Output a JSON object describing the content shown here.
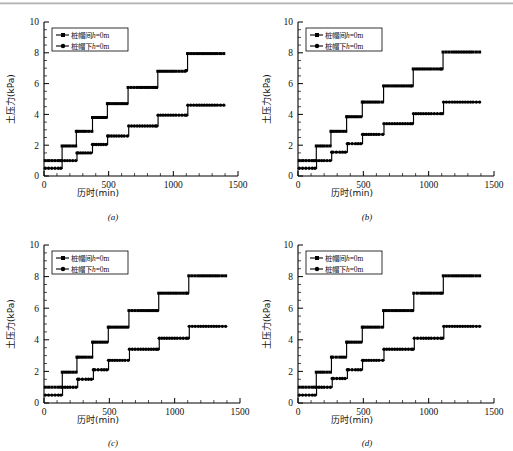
{
  "figure": {
    "background": "#ffffff",
    "ink": "#000000",
    "panel_count": 4
  },
  "axes": {
    "x_title": "历时(min)",
    "y_title": "土压力(kPa)",
    "x_ticks": [
      0,
      500,
      1000,
      1500
    ],
    "y_ticks": [
      0,
      2,
      4,
      6,
      8,
      10
    ],
    "x_minor_step": 100,
    "y_minor_step": 0.5,
    "xlim": [
      0,
      1500
    ],
    "ylim": [
      0,
      10
    ],
    "grid": false
  },
  "legend": {
    "position": "upper-left",
    "entries": [
      {
        "label": "桩帽间",
        "suffix": "h",
        "equals": "=0m",
        "marker": "square"
      },
      {
        "label": "桩帽下",
        "suffix": "h",
        "equals": "=0m",
        "marker": "circle"
      }
    ]
  },
  "chart_data": [
    {
      "id": "a",
      "panel_label": "(a)",
      "type": "line",
      "title": "",
      "xlabel": "历时(min)",
      "ylabel": "土压力(kPa)",
      "xlim": [
        0,
        1500
      ],
      "ylim": [
        0,
        10
      ],
      "grid": false,
      "series": [
        {
          "name": "桩帽间h=0m",
          "marker": "square",
          "x": [
            10,
            60,
            110,
            130,
            140,
            200,
            245,
            250,
            260,
            320,
            370,
            375,
            385,
            440,
            480,
            490,
            500,
            560,
            620,
            640,
            650,
            720,
            800,
            860,
            870,
            880,
            940,
            1020,
            1090,
            1100,
            1110,
            1180,
            1260,
            1340,
            1390
          ],
          "y": [
            1.0,
            1.0,
            1.0,
            1.0,
            1.95,
            1.95,
            1.95,
            2.9,
            2.9,
            2.9,
            2.9,
            3.8,
            3.8,
            3.8,
            3.8,
            4.7,
            4.7,
            4.7,
            4.7,
            4.7,
            5.75,
            5.75,
            5.75,
            5.75,
            5.75,
            6.8,
            6.8,
            6.8,
            6.8,
            6.85,
            7.95,
            7.95,
            7.95,
            7.95,
            7.95
          ]
        },
        {
          "name": "桩帽下h=0m",
          "marker": "circle",
          "x": [
            10,
            60,
            110,
            130,
            140,
            200,
            245,
            255,
            265,
            320,
            360,
            375,
            385,
            440,
            480,
            492,
            502,
            560,
            620,
            645,
            655,
            720,
            800,
            860,
            872,
            882,
            940,
            1020,
            1090,
            1102,
            1112,
            1180,
            1260,
            1340,
            1390
          ],
          "y": [
            0.5,
            0.5,
            0.5,
            0.5,
            1.0,
            1.0,
            1.0,
            1.5,
            1.5,
            1.5,
            1.5,
            2.05,
            2.05,
            2.05,
            2.05,
            2.6,
            2.6,
            2.6,
            2.6,
            2.6,
            3.25,
            3.25,
            3.25,
            3.25,
            3.25,
            3.95,
            3.95,
            3.95,
            3.95,
            3.95,
            4.6,
            4.6,
            4.6,
            4.6,
            4.6
          ]
        }
      ]
    },
    {
      "id": "b",
      "panel_label": "(b)",
      "type": "line",
      "title": "",
      "xlabel": "历时(min)",
      "ylabel": "土压力(kPa)",
      "xlim": [
        0,
        1500
      ],
      "ylim": [
        0,
        10
      ],
      "grid": false,
      "series": [
        {
          "name": "桩帽间h=0m",
          "marker": "square",
          "x": [
            10,
            60,
            110,
            130,
            140,
            200,
            245,
            252,
            262,
            320,
            365,
            372,
            382,
            440,
            480,
            492,
            502,
            560,
            620,
            645,
            655,
            720,
            800,
            860,
            872,
            882,
            940,
            1020,
            1090,
            1100,
            1110,
            1180,
            1260,
            1340,
            1390
          ],
          "y": [
            1.0,
            1.0,
            1.0,
            1.0,
            1.95,
            1.95,
            1.95,
            2.9,
            2.9,
            2.9,
            2.9,
            3.85,
            3.85,
            3.85,
            3.85,
            4.8,
            4.8,
            4.8,
            4.8,
            4.8,
            5.85,
            5.85,
            5.85,
            5.85,
            5.85,
            6.95,
            6.95,
            6.95,
            6.95,
            6.95,
            8.05,
            8.05,
            8.05,
            8.05,
            8.05
          ]
        },
        {
          "name": "桩帽下h=0m",
          "marker": "circle",
          "x": [
            10,
            60,
            110,
            130,
            142,
            200,
            245,
            258,
            268,
            320,
            362,
            378,
            388,
            440,
            480,
            494,
            504,
            560,
            620,
            648,
            658,
            720,
            800,
            860,
            874,
            884,
            940,
            1020,
            1090,
            1104,
            1114,
            1180,
            1260,
            1340,
            1390
          ],
          "y": [
            0.5,
            0.5,
            0.5,
            0.5,
            1.0,
            1.0,
            1.0,
            1.55,
            1.55,
            1.55,
            1.55,
            2.1,
            2.1,
            2.1,
            2.1,
            2.7,
            2.7,
            2.7,
            2.7,
            2.7,
            3.4,
            3.4,
            3.4,
            3.4,
            3.4,
            4.05,
            4.05,
            4.05,
            4.05,
            4.05,
            4.8,
            4.8,
            4.8,
            4.8,
            4.8
          ]
        }
      ]
    },
    {
      "id": "c",
      "panel_label": "(c)",
      "type": "line",
      "title": "",
      "xlabel": "历时(min)",
      "ylabel": "土压力(kPa)",
      "xlim": [
        0,
        1500
      ],
      "ylim": [
        0,
        10
      ],
      "grid": false,
      "series": [
        {
          "name": "桩帽间h=0m",
          "marker": "square",
          "x": [
            10,
            60,
            110,
            130,
            140,
            200,
            245,
            252,
            262,
            320,
            365,
            372,
            382,
            440,
            480,
            492,
            502,
            560,
            620,
            640,
            650,
            720,
            800,
            855,
            868,
            878,
            940,
            1020,
            1085,
            1098,
            1108,
            1180,
            1260,
            1340,
            1390
          ],
          "y": [
            1.0,
            1.0,
            1.0,
            1.0,
            1.95,
            1.95,
            1.95,
            2.9,
            2.9,
            2.9,
            2.9,
            3.85,
            3.85,
            3.85,
            3.85,
            4.8,
            4.8,
            4.8,
            4.8,
            4.8,
            5.85,
            5.85,
            5.85,
            5.85,
            5.85,
            6.95,
            6.95,
            6.95,
            6.95,
            6.95,
            8.05,
            8.05,
            8.05,
            8.05,
            8.05
          ]
        },
        {
          "name": "桩帽下h=0m",
          "marker": "circle",
          "x": [
            10,
            60,
            110,
            130,
            142,
            200,
            245,
            258,
            268,
            320,
            362,
            378,
            388,
            440,
            480,
            494,
            504,
            560,
            620,
            644,
            654,
            720,
            800,
            858,
            872,
            882,
            940,
            1020,
            1088,
            1102,
            1112,
            1180,
            1260,
            1340,
            1390
          ],
          "y": [
            0.5,
            0.5,
            0.5,
            0.5,
            1.0,
            1.0,
            1.0,
            1.5,
            1.5,
            1.5,
            1.5,
            2.1,
            2.1,
            2.1,
            2.1,
            2.7,
            2.7,
            2.7,
            2.7,
            2.7,
            3.4,
            3.4,
            3.4,
            3.4,
            3.4,
            4.1,
            4.1,
            4.1,
            4.1,
            4.1,
            4.85,
            4.85,
            4.85,
            4.85,
            4.85
          ]
        }
      ]
    },
    {
      "id": "d",
      "panel_label": "(d)",
      "type": "line",
      "title": "",
      "xlabel": "历时(min)",
      "ylabel": "土压力(kPa)",
      "xlim": [
        0,
        1500
      ],
      "ylim": [
        0,
        10
      ],
      "grid": false,
      "series": [
        {
          "name": "桩帽间h=0m",
          "marker": "square",
          "x": [
            10,
            60,
            110,
            130,
            140,
            200,
            248,
            256,
            266,
            320,
            362,
            372,
            382,
            440,
            480,
            492,
            502,
            560,
            620,
            645,
            655,
            720,
            800,
            865,
            876,
            886,
            940,
            1020,
            1090,
            1102,
            1112,
            1180,
            1260,
            1340,
            1390
          ],
          "y": [
            1.0,
            1.0,
            1.0,
            1.0,
            1.95,
            1.95,
            1.95,
            2.9,
            2.9,
            2.9,
            2.9,
            3.85,
            3.85,
            3.85,
            3.85,
            4.8,
            4.8,
            4.8,
            4.8,
            4.8,
            5.85,
            5.85,
            5.85,
            5.85,
            5.85,
            6.95,
            6.95,
            6.95,
            6.95,
            6.95,
            8.05,
            8.05,
            8.05,
            8.05,
            8.05
          ]
        },
        {
          "name": "桩帽下h=0m",
          "marker": "circle",
          "x": [
            10,
            60,
            110,
            130,
            142,
            200,
            248,
            262,
            272,
            320,
            360,
            378,
            388,
            440,
            480,
            494,
            504,
            560,
            620,
            648,
            658,
            720,
            800,
            868,
            880,
            890,
            940,
            1020,
            1092,
            1106,
            1116,
            1180,
            1260,
            1340,
            1390
          ],
          "y": [
            0.5,
            0.5,
            0.5,
            0.5,
            1.0,
            1.0,
            1.0,
            1.55,
            1.55,
            1.55,
            1.55,
            2.1,
            2.1,
            2.1,
            2.1,
            2.7,
            2.7,
            2.7,
            2.7,
            2.7,
            3.4,
            3.4,
            3.4,
            3.4,
            3.4,
            4.1,
            4.1,
            4.1,
            4.1,
            4.1,
            4.85,
            4.85,
            4.85,
            4.85,
            4.85
          ]
        }
      ]
    }
  ]
}
